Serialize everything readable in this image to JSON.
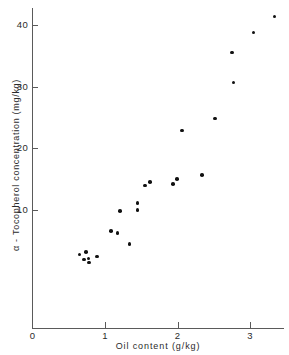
{
  "chart_data": {
    "type": "scatter",
    "title": "",
    "xlabel": "Oil content (g/kg)",
    "ylabel": "α - Tocopherol  concentration  (mg/kg)",
    "xlim": [
      0,
      3.48
    ],
    "ylim": [
      -9.2,
      42.7
    ],
    "xticks": [
      0,
      1,
      2,
      3
    ],
    "xticklabels": [
      "0",
      "1",
      "2",
      "3"
    ],
    "yticks": [
      10,
      20,
      30,
      40
    ],
    "yticklabels": [
      "10",
      "20",
      "30",
      "40"
    ],
    "grid": false,
    "legend": null,
    "marker": "filled-circle",
    "marker_color": "#111111",
    "axis_color": "#5a5a5a",
    "background_color": "#ffffff",
    "n_points": 23,
    "points": [
      {
        "x": 0.65,
        "y": 2.8
      },
      {
        "x": 0.74,
        "y": 3.2
      },
      {
        "x": 0.71,
        "y": 2.0
      },
      {
        "x": 0.77,
        "y": 2.1
      },
      {
        "x": 0.78,
        "y": 1.5
      },
      {
        "x": 0.89,
        "y": 2.5
      },
      {
        "x": 1.08,
        "y": 6.6
      },
      {
        "x": 1.17,
        "y": 6.3
      },
      {
        "x": 1.34,
        "y": 4.5
      },
      {
        "x": 1.21,
        "y": 9.8
      },
      {
        "x": 1.45,
        "y": 10.0
      },
      {
        "x": 1.45,
        "y": 11.1
      },
      {
        "x": 1.55,
        "y": 14.0
      },
      {
        "x": 1.62,
        "y": 14.5
      },
      {
        "x": 1.94,
        "y": 14.2
      },
      {
        "x": 1.99,
        "y": 15.0
      },
      {
        "x": 2.34,
        "y": 15.7
      },
      {
        "x": 2.06,
        "y": 22.9
      },
      {
        "x": 2.52,
        "y": 24.8
      },
      {
        "x": 2.77,
        "y": 30.7
      },
      {
        "x": 2.75,
        "y": 35.5
      },
      {
        "x": 3.05,
        "y": 38.8
      },
      {
        "x": 3.34,
        "y": 41.4
      }
    ]
  }
}
